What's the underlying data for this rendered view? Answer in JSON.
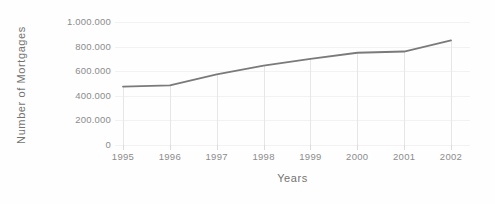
{
  "chart_data": {
    "type": "line",
    "title": "",
    "xlabel": "Years",
    "ylabel": "Number of Mortgages",
    "categories": [
      "1995",
      "1996",
      "1997",
      "1998",
      "1999",
      "2000",
      "2001",
      "2002"
    ],
    "values": [
      475000,
      485000,
      575000,
      645000,
      700000,
      750000,
      760000,
      850000
    ],
    "series": [
      {
        "name": "Number of Mortgages",
        "values": [
          475000,
          485000,
          575000,
          645000,
          700000,
          750000,
          760000,
          850000
        ]
      }
    ],
    "ylim": [
      0,
      1000000
    ],
    "y_ticks": [
      0,
      200000,
      400000,
      600000,
      800000,
      1000000
    ],
    "y_tick_labels": [
      "0",
      "200.000",
      "400.000",
      "600.000",
      "800.000",
      "1.000.000"
    ],
    "x_tick_labels": [
      "1995",
      "1996",
      "1997",
      "1998",
      "1999",
      "2000",
      "2001",
      "2002"
    ],
    "grid": true,
    "grid_axis": "y",
    "legend": false,
    "legend_position": "none",
    "line_color": "#7a7a7a",
    "gridline_color": "#f2f2f2",
    "dropline_color": "#e6e6e6",
    "tick_label_color": "#8c8c8c",
    "axis_title_color": "#737373",
    "background_color": "#fefefe",
    "has_droplines": true,
    "annotations": []
  }
}
